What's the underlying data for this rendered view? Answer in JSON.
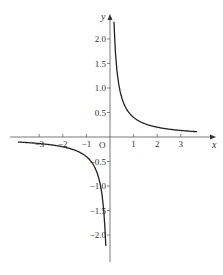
{
  "chart_data": {
    "type": "line",
    "title": "",
    "xlabel": "x",
    "ylabel": "y",
    "origin_label": "O",
    "xlim": [
      -3.9,
      3.9
    ],
    "ylim": [
      -2.4,
      2.4
    ],
    "x_ticks": [
      -3,
      -2,
      -1,
      1,
      2,
      3
    ],
    "x_tick_labels": [
      "−3",
      "−2",
      "−1",
      "1",
      "2",
      "3"
    ],
    "y_ticks": [
      2.0,
      1.5,
      1.0,
      0.5,
      -0.5,
      -1.0,
      -1.5,
      -2.0
    ],
    "y_tick_labels": [
      "2.0",
      "1.5",
      "1.0",
      "0.5",
      "−0.5",
      "−1.0",
      "−1.5",
      "−2.0"
    ],
    "grid": false,
    "legend": null,
    "series": [
      {
        "name": "y = k/x (first quadrant branch)",
        "x": [
          0.17,
          0.25,
          0.5,
          1,
          1.5,
          2,
          2.5,
          3,
          3.7
        ],
        "values": [
          2.35,
          1.6,
          0.8,
          0.4,
          0.27,
          0.2,
          0.16,
          0.13,
          0.11
        ]
      },
      {
        "name": "y = k/x (third quadrant branch)",
        "x": [
          -3.7,
          -3,
          -2.5,
          -2,
          -1.5,
          -1,
          -0.5,
          -0.25,
          -0.17
        ],
        "values": [
          -0.11,
          -0.13,
          -0.16,
          -0.2,
          -0.27,
          -0.4,
          -0.8,
          -1.6,
          -2.35
        ]
      }
    ]
  }
}
